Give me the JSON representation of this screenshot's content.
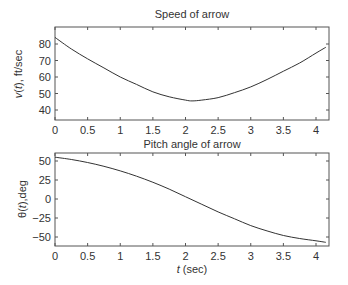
{
  "chart_data": [
    {
      "type": "line",
      "title": "Speed of arrow",
      "xlabel": "",
      "ylabel": "v(t), ft/sec",
      "xlim": [
        0,
        4.2
      ],
      "ylim": [
        35,
        90
      ],
      "xticks": [
        0,
        0.5,
        1,
        1.5,
        2,
        2.5,
        3,
        3.5,
        4
      ],
      "xtick_labels": [
        "0",
        "0.5",
        "1",
        "1.5",
        "2",
        "2.5",
        "3",
        "3.5",
        "4"
      ],
      "yticks": [
        40,
        50,
        60,
        70,
        80
      ],
      "ytick_labels": [
        "40",
        "50",
        "60",
        "70",
        "80"
      ],
      "grid": false,
      "series": [
        {
          "name": "v(t)",
          "x": [
            0,
            0.25,
            0.5,
            0.75,
            1.0,
            1.25,
            1.5,
            1.75,
            2.0,
            2.1,
            2.25,
            2.5,
            2.75,
            3.0,
            3.25,
            3.5,
            3.75,
            4.0,
            4.15
          ],
          "y": [
            84,
            77,
            71,
            65.5,
            60,
            55.5,
            51,
            48,
            46,
            45.5,
            46,
            47.5,
            50.5,
            54,
            58.5,
            63.5,
            68.5,
            74.5,
            78
          ]
        }
      ]
    },
    {
      "type": "line",
      "title": "Pitch angle of arrow",
      "xlabel": "t (sec)",
      "ylabel": "θ(t), deg",
      "xlim": [
        0,
        4.2
      ],
      "ylim": [
        -62,
        60
      ],
      "xticks": [
        0,
        0.5,
        1,
        1.5,
        2,
        2.5,
        3,
        3.5,
        4
      ],
      "xtick_labels": [
        "0",
        "0.5",
        "1",
        "1.5",
        "2",
        "2.5",
        "3",
        "3.5",
        "4"
      ],
      "yticks": [
        -50,
        -25,
        0,
        25,
        50
      ],
      "ytick_labels": [
        "−50",
        "−25",
        "0",
        "25",
        "50"
      ],
      "grid": false,
      "series": [
        {
          "name": "θ(t)",
          "x": [
            0,
            0.25,
            0.5,
            0.75,
            1.0,
            1.25,
            1.5,
            1.75,
            2.0,
            2.25,
            2.5,
            2.75,
            3.0,
            3.25,
            3.5,
            3.75,
            4.0,
            4.15
          ],
          "y": [
            55,
            52,
            48,
            43,
            37,
            30,
            22,
            13,
            3,
            -7,
            -17,
            -26,
            -35,
            -42,
            -48,
            -52,
            -55,
            -57
          ]
        }
      ]
    }
  ],
  "plots": [
    {
      "title": "Speed of arrow",
      "ylabel_parts": [
        "v",
        "(",
        "t",
        "), ft/sec"
      ]
    },
    {
      "title": "Pitch angle of arrow",
      "ylabel_parts": [
        "θ(",
        "t",
        "),deg"
      ],
      "xlabel_parts": [
        "t",
        " (sec)"
      ]
    }
  ],
  "style": {
    "line_color": "#333333",
    "axis_color": "#555555",
    "background": "#ffffff"
  }
}
